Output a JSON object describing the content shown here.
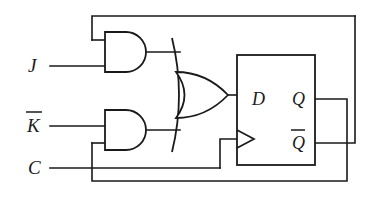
{
  "diagram": {
    "background_color": "#ffffff",
    "line_color": "#1a1a1a",
    "width": 374,
    "height": 197
  },
  "inputs": [
    {
      "id": "j",
      "label": "J",
      "overline": false,
      "x": 28,
      "y": 70
    },
    {
      "id": "kbar",
      "label": "K",
      "overline": true,
      "x": 27,
      "y": 130
    },
    {
      "id": "c",
      "label": "C",
      "overline": false,
      "x": 28,
      "y": 172
    }
  ],
  "flipflop": {
    "name": "d-flip-flop",
    "box": {
      "x": 237,
      "y": 55,
      "w": 78,
      "h": 110
    },
    "pins": [
      {
        "id": "d-input",
        "label": "D",
        "overline": false,
        "x": 252,
        "y": 99
      },
      {
        "id": "q-output",
        "label": "Q",
        "overline": false,
        "x": 294,
        "y": 99
      },
      {
        "id": "qbar-output",
        "label": "Q",
        "overline": true,
        "x": 294,
        "y": 143
      }
    ],
    "clock_marker": "clock-triangle"
  },
  "gates": [
    {
      "id": "and-top",
      "type": "AND",
      "x": 105,
      "y": 32,
      "w": 42,
      "h": 40
    },
    {
      "id": "and-bottom",
      "type": "AND",
      "x": 105,
      "y": 110,
      "w": 42,
      "h": 40
    },
    {
      "id": "or-gate",
      "type": "OR",
      "x": 176,
      "y": 72,
      "w": 52,
      "h": 46
    }
  ],
  "nets": [
    {
      "id": "j-to-and-top",
      "from": "J",
      "to": "and-top.in2"
    },
    {
      "id": "kbar-to-and-bottom",
      "from": "K-bar",
      "to": "and-bottom.in1"
    },
    {
      "id": "qbar-feedback-top",
      "from": "Q-bar",
      "to": "and-top.in1"
    },
    {
      "id": "q-feedback-bottom",
      "from": "Q",
      "to": "and-bottom.in2"
    },
    {
      "id": "and-top-to-or",
      "from": "and-top.out",
      "to": "or-gate.in1"
    },
    {
      "id": "and-bottom-to-or",
      "from": "and-bottom.out",
      "to": "or-gate.in2"
    },
    {
      "id": "or-to-d",
      "from": "or-gate.out",
      "to": "D"
    },
    {
      "id": "c-to-clock",
      "from": "C",
      "to": "clock-input"
    }
  ]
}
